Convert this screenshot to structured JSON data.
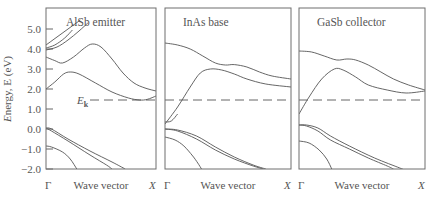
{
  "chart_data": {
    "type": "line",
    "title": "",
    "ylabel": "Energy, E (eV)",
    "xlabel": "Wave vector",
    "ylim": [
      -2.0,
      6.05
    ],
    "xlim": [
      0,
      1
    ],
    "yticks": [
      {
        "value": 5.0,
        "label": "5.0"
      },
      {
        "value": 4.0,
        "label": "4.0"
      },
      {
        "value": 3.0,
        "label": "3.0"
      },
      {
        "value": 2.0,
        "label": "2.0"
      },
      {
        "value": 1.0,
        "label": "1.0"
      },
      {
        "value": 0.0,
        "label": "0.0"
      },
      {
        "value": -1.0,
        "label": "−1.0"
      },
      {
        "value": -2.0,
        "label": "−2.0"
      }
    ],
    "x_endpoints": {
      "start": "Γ",
      "end": "X"
    },
    "reference_line": {
      "label": "E",
      "subscript": "k",
      "value": 1.45,
      "style": "dashed"
    },
    "grid": false,
    "panels": [
      {
        "name": "AlSb emitter",
        "bands": [
          {
            "name": "cb-upper-1",
            "points": [
              [
                0,
                4.2
              ],
              [
                0.1,
                4.6
              ],
              [
                0.2,
                5.0
              ],
              [
                0.3,
                5.4
              ],
              [
                0.31,
                5.45
              ]
            ]
          },
          {
            "name": "cb-upper-2",
            "points": [
              [
                0,
                3.95
              ],
              [
                0.1,
                4.1
              ],
              [
                0.2,
                4.45
              ],
              [
                0.3,
                4.9
              ],
              [
                0.38,
                5.3
              ]
            ]
          },
          {
            "name": "cb-upper-3",
            "points": [
              [
                0,
                4.05
              ],
              [
                0.08,
                4.2
              ],
              [
                0.17,
                4.55
              ],
              [
                0.24,
                4.95
              ]
            ]
          },
          {
            "name": "cb-second",
            "points": [
              [
                0,
                3.6
              ],
              [
                0.08,
                3.42
              ],
              [
                0.15,
                3.3
              ],
              [
                0.25,
                3.6
              ],
              [
                0.35,
                4.05
              ],
              [
                0.42,
                4.25
              ],
              [
                0.5,
                4.1
              ],
              [
                0.6,
                3.5
              ],
              [
                0.7,
                2.8
              ],
              [
                0.8,
                2.3
              ],
              [
                0.9,
                2.05
              ],
              [
                1.0,
                1.9
              ]
            ]
          },
          {
            "name": "cb-lowest",
            "points": [
              [
                0,
                2.0
              ],
              [
                0.08,
                2.35
              ],
              [
                0.16,
                2.75
              ],
              [
                0.22,
                2.85
              ],
              [
                0.3,
                2.75
              ],
              [
                0.45,
                2.3
              ],
              [
                0.6,
                1.85
              ],
              [
                0.75,
                1.55
              ],
              [
                0.85,
                1.45
              ],
              [
                0.92,
                1.48
              ],
              [
                1.0,
                1.65
              ]
            ]
          },
          {
            "name": "vb-heavy-hole",
            "points": [
              [
                0,
                0.05
              ],
              [
                0.05,
                0.0
              ],
              [
                0.2,
                -0.5
              ],
              [
                0.4,
                -1.1
              ],
              [
                0.6,
                -1.65
              ],
              [
                0.72,
                -2.0
              ]
            ]
          },
          {
            "name": "vb-light-hole",
            "points": [
              [
                0,
                0.05
              ],
              [
                0.05,
                -0.1
              ],
              [
                0.2,
                -0.6
              ],
              [
                0.4,
                -1.3
              ],
              [
                0.55,
                -1.8
              ],
              [
                0.6,
                -2.0
              ]
            ]
          },
          {
            "name": "vb-split-off",
            "points": [
              [
                0,
                -0.85
              ],
              [
                0.05,
                -0.9
              ],
              [
                0.15,
                -1.15
              ],
              [
                0.22,
                -1.5
              ],
              [
                0.28,
                -2.0
              ]
            ]
          }
        ]
      },
      {
        "name": "InAs base",
        "bands": [
          {
            "name": "cb-upper",
            "points": [
              [
                0,
                4.3
              ],
              [
                0.1,
                4.2
              ],
              [
                0.2,
                4.0
              ],
              [
                0.3,
                3.65
              ],
              [
                0.4,
                3.3
              ],
              [
                0.48,
                3.2
              ],
              [
                0.55,
                3.22
              ],
              [
                0.65,
                3.1
              ],
              [
                0.75,
                2.85
              ],
              [
                0.85,
                2.65
              ],
              [
                1.0,
                2.5
              ]
            ]
          },
          {
            "name": "cb-second",
            "points": [
              [
                0,
                0.25
              ],
              [
                0.1,
                1.1
              ],
              [
                0.2,
                2.1
              ],
              [
                0.28,
                2.8
              ],
              [
                0.36,
                3.0
              ],
              [
                0.45,
                2.95
              ],
              [
                0.55,
                2.75
              ],
              [
                0.65,
                2.5
              ],
              [
                0.8,
                2.25
              ],
              [
                1.0,
                2.1
              ]
            ]
          },
          {
            "name": "cb-lowest",
            "points": [
              [
                0,
                0.35
              ],
              [
                0.05,
                0.4
              ],
              [
                0.1,
                0.75
              ]
            ]
          },
          {
            "name": "vb-heavy-hole",
            "points": [
              [
                0,
                0.0
              ],
              [
                0.1,
                -0.05
              ],
              [
                0.25,
                -0.35
              ],
              [
                0.4,
                -0.9
              ],
              [
                0.55,
                -1.4
              ],
              [
                0.7,
                -1.8
              ],
              [
                0.8,
                -2.0
              ]
            ]
          },
          {
            "name": "vb-light-hole",
            "points": [
              [
                0,
                0.0
              ],
              [
                0.1,
                -0.1
              ],
              [
                0.25,
                -0.5
              ],
              [
                0.4,
                -1.05
              ],
              [
                0.55,
                -1.5
              ],
              [
                0.7,
                -1.85
              ],
              [
                0.78,
                -2.0
              ]
            ]
          },
          {
            "name": "vb-split-off",
            "points": [
              [
                0,
                -0.4
              ],
              [
                0.08,
                -0.55
              ],
              [
                0.15,
                -0.85
              ],
              [
                0.22,
                -1.35
              ],
              [
                0.26,
                -1.7
              ],
              [
                0.29,
                -2.0
              ]
            ]
          }
        ]
      },
      {
        "name": "GaSb collector",
        "bands": [
          {
            "name": "cb-upper",
            "points": [
              [
                0,
                3.9
              ],
              [
                0.1,
                3.85
              ],
              [
                0.2,
                3.65
              ],
              [
                0.3,
                3.45
              ],
              [
                0.38,
                3.5
              ],
              [
                0.45,
                3.45
              ],
              [
                0.55,
                3.2
              ],
              [
                0.65,
                2.85
              ],
              [
                0.75,
                2.5
              ],
              [
                0.87,
                2.2
              ],
              [
                1.0,
                1.95
              ]
            ]
          },
          {
            "name": "cb-second",
            "points": [
              [
                0,
                0.75
              ],
              [
                0.08,
                1.6
              ],
              [
                0.18,
                2.5
              ],
              [
                0.28,
                3.0
              ],
              [
                0.35,
                2.95
              ],
              [
                0.45,
                2.6
              ],
              [
                0.55,
                2.2
              ],
              [
                0.7,
                1.95
              ],
              [
                0.85,
                1.8
              ],
              [
                1.0,
                1.9
              ]
            ]
          },
          {
            "name": "vb-heavy-hole",
            "points": [
              [
                0,
                0.2
              ],
              [
                0.06,
                0.2
              ],
              [
                0.15,
                0.05
              ],
              [
                0.25,
                -0.35
              ],
              [
                0.4,
                -0.85
              ],
              [
                0.6,
                -1.45
              ],
              [
                0.8,
                -1.95
              ],
              [
                0.82,
                -2.0
              ]
            ]
          },
          {
            "name": "vb-light-hole",
            "points": [
              [
                0,
                0.2
              ],
              [
                0.06,
                0.15
              ],
              [
                0.15,
                -0.1
              ],
              [
                0.25,
                -0.55
              ],
              [
                0.4,
                -1.0
              ],
              [
                0.55,
                -1.45
              ],
              [
                0.7,
                -1.85
              ],
              [
                0.75,
                -2.0
              ]
            ]
          },
          {
            "name": "vb-split-off",
            "points": [
              [
                0,
                -0.6
              ],
              [
                0.08,
                -0.7
              ],
              [
                0.16,
                -1.05
              ],
              [
                0.22,
                -1.5
              ],
              [
                0.26,
                -2.0
              ]
            ]
          }
        ]
      }
    ]
  }
}
